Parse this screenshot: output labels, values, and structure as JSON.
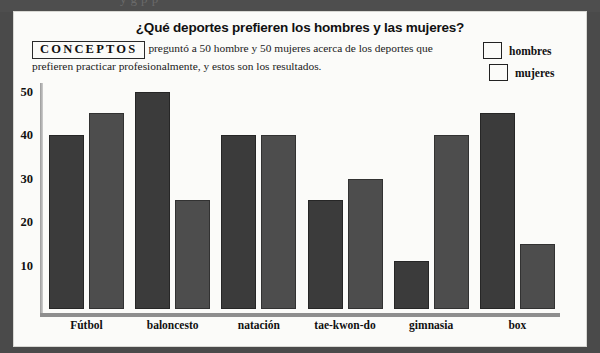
{
  "page": {
    "top_partial_text": "y         g                                                  p p"
  },
  "card": {
    "title": "¿Qué deportes prefieren los hombres y las mujeres?",
    "logo": "CONCEPTOS",
    "blurb": "preguntó a 50 hombre y 50 mujeres acerca de los deportes que prefieren practicar profesionalmente, y estos son los resultados."
  },
  "legend": {
    "items": [
      {
        "label": "hombres",
        "color": "#3b3b3b"
      },
      {
        "label": "mujeres",
        "color": "#4d4d4d"
      }
    ]
  },
  "chart_data": {
    "type": "bar",
    "title": "¿Qué deportes prefieren los hombres y las mujeres?",
    "xlabel": "",
    "ylabel": "",
    "ylim": [
      0,
      52
    ],
    "yticks": [
      10,
      20,
      30,
      40,
      50
    ],
    "ytick_labels": [
      "10",
      "20",
      "30",
      "40",
      "50"
    ],
    "grid": false,
    "legend_position": "top-right",
    "categories": [
      "Fútbol",
      "baloncesto",
      "natación",
      "tae-kwon-do",
      "gimnasia",
      "box"
    ],
    "series": [
      {
        "name": "hombres",
        "color": "#3b3b3b",
        "values": [
          40,
          50,
          40,
          25,
          11,
          45
        ]
      },
      {
        "name": "mujeres",
        "color": "#4d4d4d",
        "values": [
          45,
          25,
          40,
          30,
          40,
          15
        ]
      }
    ]
  }
}
